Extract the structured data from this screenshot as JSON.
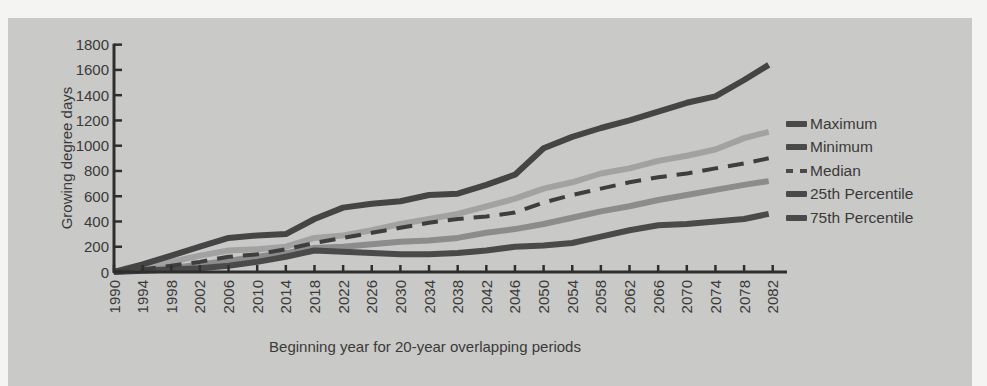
{
  "chart_data": {
    "type": "line",
    "title": "",
    "xlabel": "Beginning year for 20-year overlapping periods",
    "ylabel": "Growing degree days",
    "ylim": [
      0,
      1800
    ],
    "yticks": [
      0,
      200,
      400,
      600,
      800,
      1000,
      1200,
      1400,
      1600,
      1800
    ],
    "grid": false,
    "legend_position": "right",
    "x": [
      1990,
      1994,
      1998,
      2002,
      2006,
      2010,
      2014,
      2018,
      2022,
      2026,
      2030,
      2034,
      2038,
      2042,
      2046,
      2050,
      2054,
      2058,
      2062,
      2066,
      2070,
      2074,
      2078,
      2082
    ],
    "series": [
      {
        "name": "Maximum",
        "color": "#454545",
        "dash": false,
        "values": [
          0,
          60,
          130,
          200,
          270,
          290,
          300,
          420,
          510,
          540,
          560,
          610,
          620,
          690,
          770,
          980,
          1070,
          1140,
          1200,
          1270,
          1340,
          1390,
          1520,
          1640
        ]
      },
      {
        "name": "Minimum",
        "color": "#4a4a4a",
        "dash": false,
        "values": [
          0,
          10,
          20,
          30,
          50,
          80,
          120,
          170,
          160,
          150,
          140,
          140,
          150,
          170,
          200,
          210,
          230,
          280,
          330,
          370,
          380,
          400,
          420,
          460
        ]
      },
      {
        "name": "Median",
        "color": "#3e3e3e",
        "dash": true,
        "values": [
          0,
          20,
          50,
          80,
          120,
          140,
          180,
          230,
          270,
          310,
          350,
          390,
          420,
          440,
          470,
          550,
          610,
          660,
          710,
          750,
          780,
          820,
          860,
          900
        ]
      },
      {
        "name": "25th Percentile",
        "color": "#8c8c8c",
        "dash": false,
        "values": [
          0,
          20,
          30,
          60,
          90,
          120,
          150,
          190,
          200,
          220,
          240,
          250,
          270,
          310,
          340,
          380,
          430,
          480,
          520,
          570,
          610,
          650,
          690,
          720
        ]
      },
      {
        "name": "75th Percentile",
        "color": "#a2a2a2",
        "dash": false,
        "values": [
          0,
          40,
          80,
          130,
          170,
          180,
          200,
          270,
          290,
          330,
          380,
          420,
          460,
          520,
          580,
          660,
          710,
          780,
          820,
          880,
          920,
          970,
          1060,
          1110
        ]
      }
    ]
  },
  "legend": {
    "items": [
      {
        "label": "Maximum"
      },
      {
        "label": "Minimum"
      },
      {
        "label": "Median"
      },
      {
        "label": "25th Percentile"
      },
      {
        "label": "75th Percentile"
      }
    ]
  },
  "colors": {
    "panel_background": "#c9c9c7",
    "page_background": "#f4f4f2",
    "axis": "#2e2e2e",
    "text": "#3a3a3a"
  }
}
